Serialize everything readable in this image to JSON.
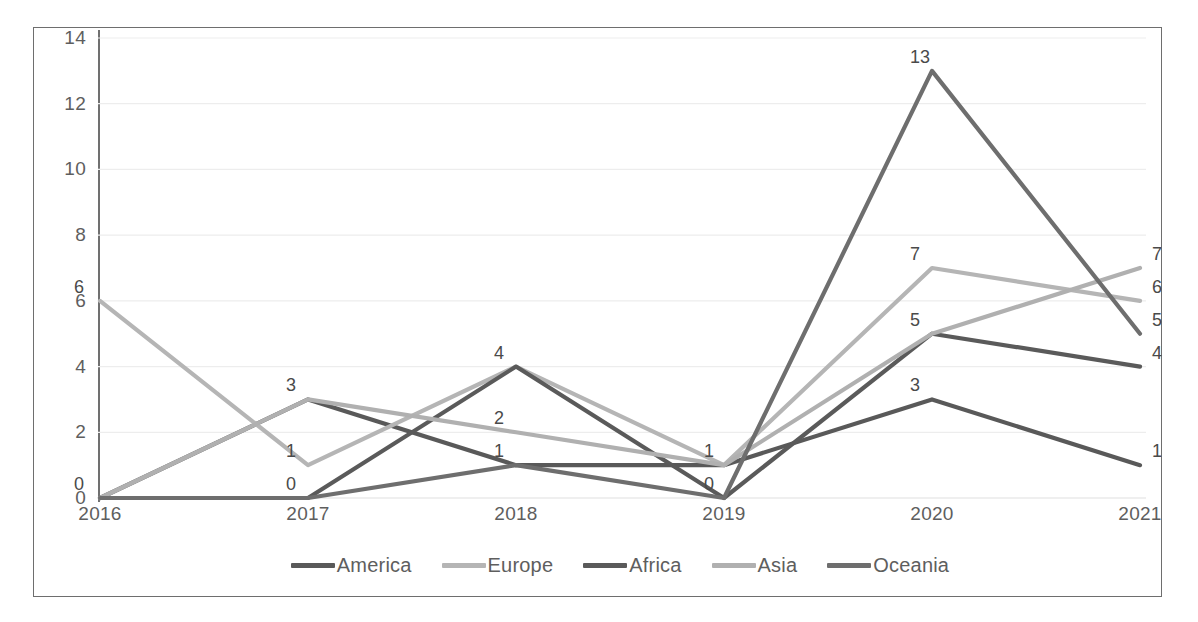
{
  "chart_data": {
    "type": "line",
    "title": "",
    "xlabel": "",
    "ylabel": "",
    "categories": [
      "2016",
      "2017",
      "2018",
      "2019",
      "2020",
      "2021"
    ],
    "x": [
      2016,
      2017,
      2018,
      2019,
      2020,
      2021
    ],
    "ylim": [
      0,
      14
    ],
    "y_ticks": [
      0,
      2,
      4,
      6,
      8,
      10,
      12,
      14
    ],
    "y_tick_labels": [
      "0",
      "2",
      "4",
      "6",
      "8",
      "10",
      "12",
      "14"
    ],
    "grid": true,
    "grid_axis": "y",
    "legend_position": "bottom",
    "data_labels": true,
    "series": [
      {
        "name": "America",
        "color": "#595959",
        "values": [
          0,
          3,
          1,
          1,
          3,
          1
        ]
      },
      {
        "name": "Europe",
        "color": "#b5b5b5",
        "values": [
          6,
          1,
          4,
          1,
          7,
          6
        ]
      },
      {
        "name": "Africa",
        "color": "#5a5a5a",
        "values": [
          0,
          0,
          4,
          0,
          5,
          4
        ]
      },
      {
        "name": "Asia",
        "color": "#b0b0b0",
        "values": [
          0,
          3,
          2,
          1,
          5,
          7
        ]
      },
      {
        "name": "Oceania",
        "color": "#6e6e6e",
        "values": [
          0,
          0,
          1,
          0,
          13,
          5
        ]
      }
    ]
  },
  "legend": {
    "items": [
      {
        "label": "America",
        "color": "#595959"
      },
      {
        "label": "Europe",
        "color": "#b5b5b5"
      },
      {
        "label": "Africa",
        "color": "#5a5a5a"
      },
      {
        "label": "Asia",
        "color": "#b0b0b0"
      },
      {
        "label": "Oceania",
        "color": "#6e6e6e"
      }
    ]
  },
  "axes": {
    "y_tick_labels": [
      "14",
      "12",
      "10",
      "8",
      "6",
      "4",
      "2",
      "0"
    ],
    "x_tick_labels": [
      "2016",
      "2017",
      "2018",
      "2019",
      "2020",
      "2021"
    ]
  },
  "style": {
    "frame_color": "#6e6e6e",
    "gridline_color": "#ededed",
    "axis_text_color": "#5e5e5e",
    "label_text_color": "#4a4a4a",
    "background": "#ffffff"
  }
}
